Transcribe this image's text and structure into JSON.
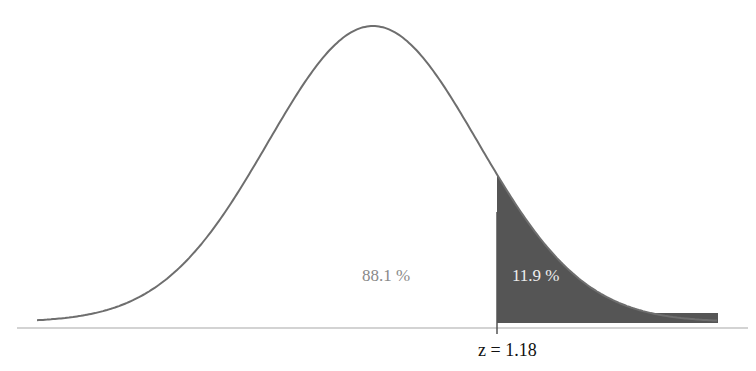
{
  "chart_data": {
    "type": "area",
    "title": "",
    "distribution": "standard normal",
    "cutoff_z": 1.18,
    "regions": [
      {
        "name": "left-region",
        "label": "88.1 %",
        "proportion": 0.881,
        "shaded": false
      },
      {
        "name": "right-tail",
        "label": "11.9 %",
        "proportion": 0.119,
        "shaded": true
      }
    ],
    "annotations": [
      "88.1 %",
      "11.9 %",
      "z = 1.18"
    ],
    "x_range": [
      -3.5,
      3.5
    ],
    "grid": false,
    "legend": null
  },
  "labels": {
    "left_pct": "88.1 %",
    "right_pct": "11.9 %",
    "z_label": "z = 1.18"
  },
  "colors": {
    "curve": "#6e6e6e",
    "shade": "#555555",
    "baseline": "#bdbdbd"
  }
}
